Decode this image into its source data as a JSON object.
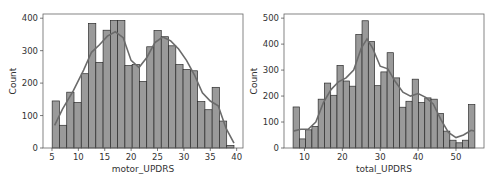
{
  "chart_data": [
    {
      "type": "bar",
      "subtype": "histogram_with_kde",
      "title": "",
      "xlabel": "motor_UPDRS",
      "ylabel": "Count",
      "xlim": [
        3.3,
        41.2
      ],
      "ylim": [
        0,
        413
      ],
      "xticks": [
        5,
        10,
        15,
        20,
        25,
        30,
        35,
        40
      ],
      "yticks": [
        0,
        100,
        200,
        300,
        400
      ],
      "grid": false,
      "legend": null,
      "bin_start": 5.04,
      "bin_width": 1.378,
      "values": [
        145,
        70,
        172,
        140,
        229,
        384,
        264,
        363,
        393,
        393,
        254,
        257,
        205,
        312,
        362,
        343,
        315,
        257,
        242,
        238,
        143,
        118,
        187,
        83,
        8
      ],
      "kde": {
        "x": [
          5.5,
          7,
          9,
          11,
          12.5,
          14,
          15.5,
          17,
          18.5,
          20,
          21.5,
          23,
          24.5,
          26,
          27.5,
          29,
          30.5,
          32,
          33.5,
          35,
          36.5,
          38,
          39.5
        ],
        "y": [
          70,
          120,
          175,
          240,
          295,
          318,
          345,
          358,
          340,
          270,
          248,
          280,
          325,
          342,
          330,
          305,
          270,
          225,
          170,
          145,
          130,
          60,
          15
        ]
      }
    },
    {
      "type": "bar",
      "subtype": "histogram_with_kde",
      "title": "",
      "xlabel": "total_UPDRS",
      "ylabel": "Count",
      "xlim": [
        4.6,
        57.4
      ],
      "ylim": [
        0,
        516
      ],
      "xticks": [
        10,
        20,
        30,
        40,
        50
      ],
      "yticks": [
        0,
        100,
        200,
        300,
        400,
        500
      ],
      "grid": false,
      "legend": null,
      "bin_start": 7.0,
      "bin_width": 1.655,
      "values": [
        158,
        35,
        70,
        83,
        188,
        250,
        203,
        318,
        258,
        238,
        437,
        490,
        410,
        240,
        293,
        367,
        270,
        157,
        180,
        265,
        175,
        193,
        188,
        133,
        65,
        30,
        20,
        30,
        167
      ],
      "kde": {
        "x": [
          7,
          9,
          11,
          13,
          15,
          17,
          19,
          21,
          23,
          25,
          26.5,
          28,
          30,
          32,
          34,
          36,
          38,
          40,
          42,
          44,
          46,
          48,
          50,
          52,
          54,
          55
        ],
        "y": [
          65,
          72,
          72,
          100,
          175,
          225,
          255,
          270,
          300,
          385,
          420,
          385,
          315,
          305,
          255,
          215,
          200,
          210,
          195,
          170,
          110,
          60,
          40,
          50,
          68,
          65
        ]
      }
    }
  ]
}
